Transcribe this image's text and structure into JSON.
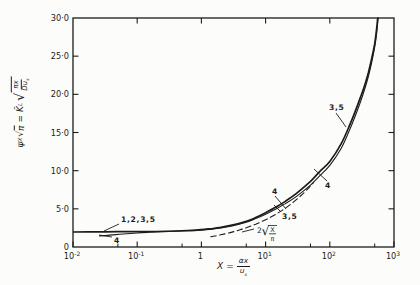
{
  "figure": {
    "background": "#fcfcfa",
    "ink": "#1c1c1c"
  },
  "chart_data": {
    "type": "line",
    "title": "",
    "x_axis": {
      "scale": "log",
      "range": [
        0.01,
        1000
      ],
      "label": "X = αx/us",
      "label_parts": {
        "lhs": "X",
        "eq": "=",
        "num": "αx",
        "den_base": "u",
        "den_sub": "s"
      },
      "major_ticks": [
        {
          "log": -2,
          "base": "10",
          "exp": "-2"
        },
        {
          "log": -1,
          "base": "10",
          "exp": "-1"
        },
        {
          "log": 0,
          "base": "1",
          "exp": ""
        },
        {
          "log": 1,
          "base": "10",
          "exp": "1"
        },
        {
          "log": 2,
          "base": "10",
          "exp": "2"
        },
        {
          "log": 3,
          "base": "10",
          "exp": "3"
        }
      ],
      "minor_tick_logs": [
        -1.301,
        -0.301,
        0.699,
        1.699,
        2.699
      ],
      "top_tick_logs": [
        -1,
        0,
        1,
        2
      ]
    },
    "y_axis": {
      "range": [
        0,
        30
      ],
      "label": "ψX√π = K̄L√(πx/Dus)",
      "label_parts": {
        "psi": "ψ",
        "psi_sub": "X",
        "sqrt": "√",
        "pi": "π",
        "eq": "=",
        "k": "K̄",
        "k_sub": "L",
        "radical": "√",
        "rad_num": "πx",
        "rad_den_base": "Du",
        "rad_den_sub": "s"
      },
      "ticks": [
        {
          "v": 0,
          "label": "0"
        },
        {
          "v": 5,
          "label": "5·0"
        },
        {
          "v": 10,
          "label": "10·0"
        },
        {
          "v": 15,
          "label": "15·0"
        },
        {
          "v": 20,
          "label": "20·0"
        },
        {
          "v": 25,
          "label": "25·0"
        },
        {
          "v": 30,
          "label": "30·0"
        }
      ],
      "side_tick_values": [
        5,
        10,
        15,
        20,
        25
      ]
    },
    "series": [
      {
        "name": "curves-1-2-3-5",
        "style": "solid",
        "width": 1.7,
        "points": [
          [
            0.01,
            1.96
          ],
          [
            0.02,
            1.98
          ],
          [
            0.05,
            2.0
          ],
          [
            0.1,
            2.01
          ],
          [
            0.2,
            2.03
          ],
          [
            0.4,
            2.1
          ],
          [
            0.7,
            2.19
          ],
          [
            1,
            2.28
          ],
          [
            1.5,
            2.43
          ],
          [
            2,
            2.57
          ],
          [
            3,
            2.85
          ],
          [
            5,
            3.35
          ],
          [
            7,
            3.85
          ],
          [
            10,
            4.5
          ],
          [
            15,
            5.3
          ],
          [
            20,
            5.95
          ],
          [
            30,
            7.0
          ],
          [
            50,
            8.6
          ],
          [
            70,
            9.9
          ],
          [
            100,
            11.2
          ],
          [
            150,
            13.5
          ],
          [
            200,
            15.8
          ],
          [
            250,
            17.8
          ],
          [
            300,
            19.6
          ],
          [
            350,
            21.2
          ],
          [
            400,
            22.9
          ],
          [
            450,
            24.7
          ],
          [
            500,
            26.6
          ],
          [
            530,
            28.2
          ],
          [
            558,
            30
          ]
        ]
      },
      {
        "name": "curve-4",
        "style": "solid",
        "width": 1.1,
        "points": [
          [
            0.026,
            1.45
          ],
          [
            0.04,
            1.58
          ],
          [
            0.06,
            1.7
          ],
          [
            0.1,
            1.83
          ],
          [
            0.15,
            1.92
          ],
          [
            0.25,
            2.0
          ],
          [
            0.4,
            2.06
          ],
          [
            0.7,
            2.14
          ],
          [
            1,
            2.22
          ],
          [
            1.5,
            2.35
          ],
          [
            2,
            2.5
          ],
          [
            3,
            2.76
          ],
          [
            5,
            3.25
          ],
          [
            7,
            3.72
          ],
          [
            10,
            4.3
          ],
          [
            15,
            5.05
          ],
          [
            20,
            5.65
          ],
          [
            30,
            6.6
          ],
          [
            50,
            8.1
          ],
          [
            70,
            9.35
          ],
          [
            100,
            10.7
          ],
          [
            150,
            12.9
          ],
          [
            200,
            15.2
          ],
          [
            250,
            17.2
          ],
          [
            300,
            19.0
          ],
          [
            350,
            20.7
          ],
          [
            400,
            22.4
          ],
          [
            450,
            24.2
          ],
          [
            500,
            26.2
          ],
          [
            535,
            27.9
          ],
          [
            566,
            30
          ]
        ]
      },
      {
        "name": "asymptote-2-sqrt-x-over-pi",
        "style": "dashed",
        "width": 1.1,
        "points": [
          [
            1.4,
            1.34
          ],
          [
            2,
            1.6
          ],
          [
            3,
            1.95
          ],
          [
            4,
            2.26
          ],
          [
            5,
            2.52
          ],
          [
            7,
            2.99
          ],
          [
            10,
            3.57
          ],
          [
            14,
            4.22
          ],
          [
            20,
            5.05
          ],
          [
            28,
            5.97
          ],
          [
            38,
            6.96
          ],
          [
            48,
            7.82
          ],
          [
            56,
            8.45
          ]
        ]
      }
    ],
    "annotations": [
      {
        "text": "1,2,3,5",
        "x": 121,
        "y": 222,
        "leader": [
          119,
          224,
          104,
          231
        ]
      },
      {
        "text": "4",
        "x": 114,
        "y": 243,
        "leader": [
          112,
          237,
          99,
          235
        ]
      },
      {
        "text": "4",
        "x": 272,
        "y": 194,
        "leader": [
          275,
          196,
          286,
          209
        ]
      },
      {
        "text": "3,5",
        "x": 282,
        "y": 219,
        "leader": [
          281,
          212,
          274,
          205
        ]
      },
      {
        "type": "radical",
        "coeff": "2",
        "num": "X",
        "den": "π",
        "x": 257,
        "y": 233,
        "leader": [
          254,
          229,
          242,
          232
        ]
      },
      {
        "text": "3,5",
        "x": 329,
        "y": 110,
        "leader": [
          336,
          113,
          346,
          127
        ]
      },
      {
        "text": "4",
        "x": 325,
        "y": 188,
        "leader": [
          327,
          181,
          314,
          169
        ]
      }
    ]
  }
}
